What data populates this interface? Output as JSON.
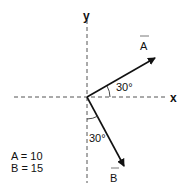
{
  "diagram": {
    "axes": {
      "x_label": "x",
      "y_label": "y"
    },
    "vectors": [
      {
        "name": "A",
        "angle_label": "30°",
        "angle_reference": "x-axis",
        "magnitude_label": "A = 10"
      },
      {
        "name": "B",
        "angle_label": "30°",
        "angle_reference": "negative y-axis",
        "magnitude_label": "B = 15"
      }
    ],
    "legend": [
      "A = 10",
      "B = 15"
    ],
    "colors": {
      "line": "#111111",
      "axis": "#555555"
    }
  }
}
